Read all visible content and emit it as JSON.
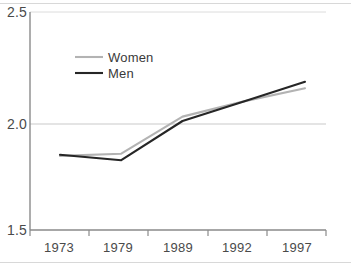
{
  "chart_data": {
    "type": "line",
    "title": "",
    "subtitle": "",
    "xlabel": "",
    "ylabel": "",
    "categories": [
      "1973",
      "1979",
      "1989",
      "1992",
      "1997"
    ],
    "x": [
      1973,
      1979,
      1989,
      1992,
      1997
    ],
    "xlim": [
      1973,
      1997
    ],
    "ylim": [
      1.5,
      2.5
    ],
    "yticks": [
      "1.5",
      "2.0",
      "2.5"
    ],
    "ytick_values": [
      1.5,
      2.0,
      2.5
    ],
    "grid": "horizontal",
    "legend_position": "upper-left-inside",
    "series": [
      {
        "name": "Women",
        "color": "#b3b3b3",
        "values": [
          1.84,
          1.85,
          2.02,
          2.09,
          2.15
        ]
      },
      {
        "name": "Men",
        "color": "#262626",
        "values": [
          1.845,
          1.82,
          2.0,
          2.09,
          2.18
        ]
      }
    ]
  },
  "axes": {
    "y_ticks": [
      {
        "label": "2.5",
        "value": 2.5
      },
      {
        "label": "2.0",
        "value": 2.0
      },
      {
        "label": "1.5",
        "value": 1.5
      }
    ],
    "x_ticks": [
      {
        "label": "1973",
        "value": 1973
      },
      {
        "label": "1979",
        "value": 1979
      },
      {
        "label": "1989",
        "value": 1989
      },
      {
        "label": "1992",
        "value": 1992
      },
      {
        "label": "1997",
        "value": 1997
      }
    ]
  },
  "legend": {
    "entries": [
      {
        "label": "Women",
        "color": "#b3b3b3"
      },
      {
        "label": "Men",
        "color": "#262626"
      }
    ]
  },
  "colors": {
    "axis": "#8a8a8a",
    "grid": "#c9c9c9",
    "text": "#3a3a3a",
    "women": "#b3b3b3",
    "men": "#262626",
    "background": "#ffffff"
  }
}
